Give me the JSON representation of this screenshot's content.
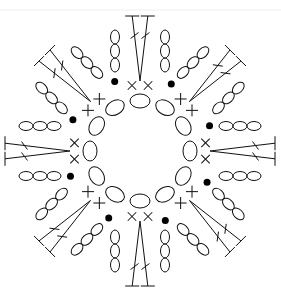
{
  "colors": {
    "ink": "#111111",
    "background": "#ffffff"
  },
  "legend_symbols": {
    "chain": "oval",
    "single_crochet": "cross (x / +)",
    "double_crochet": "T with one slash",
    "slip_stitch": "filled dot"
  },
  "center": [
    140,
    151
  ],
  "ring": {
    "count": 12,
    "radius": 50,
    "oval_rx": 7,
    "oval_ry": 10
  },
  "petals": [
    {
      "name": "top",
      "angle": -90
    },
    {
      "name": "top-right",
      "angle": -45
    },
    {
      "name": "right",
      "angle": 0
    },
    {
      "name": "bottom-right",
      "angle": 45
    },
    {
      "name": "bottom",
      "angle": 90
    },
    {
      "name": "bottom-left",
      "angle": 135
    },
    {
      "name": "left",
      "angle": 180
    },
    {
      "name": "top-left",
      "angle": -135
    }
  ],
  "petal_spec": {
    "sc_radius": 66,
    "sc_spread_deg": 7,
    "slip_radius": 74,
    "slip_spread_deg": 15,
    "chain_start": 86,
    "chain_step": 14,
    "chain_count": 3,
    "chain_offset": 25,
    "dc_base": 70,
    "dc_top": 135,
    "dc_top_spread": 13
  }
}
